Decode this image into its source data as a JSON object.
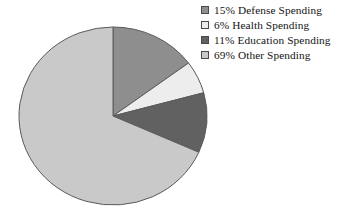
{
  "chart_data": {
    "type": "pie",
    "title": "",
    "subtitle": "",
    "xlabel": "",
    "ylabel": "",
    "grid": false,
    "legend_position": "top-right",
    "start_angle_oclock": 12,
    "direction": "clockwise",
    "categories": [
      "Defense Spending",
      "Health Spending",
      "Education Spending",
      "Other Spending"
    ],
    "values": [
      15,
      6,
      11,
      69
    ],
    "value_unit": "%",
    "colors": [
      "#8e8e8e",
      "#ededed",
      "#616161",
      "#c9c9c9"
    ],
    "slices": [
      {
        "label": "Defense Spending",
        "value": 15,
        "percent_text": "15%",
        "color": "#8e8e8e"
      },
      {
        "label": "Health Spending",
        "value": 6,
        "percent_text": "6%",
        "color": "#ededed"
      },
      {
        "label": "Education Spending",
        "value": 11,
        "percent_text": "11%",
        "color": "#616161"
      },
      {
        "label": "Other Spending",
        "value": 69,
        "percent_text": "69%",
        "color": "#c9c9c9"
      }
    ]
  },
  "legend": {
    "entries": [
      {
        "text": "15% Defense Spending",
        "color": "#8e8e8e"
      },
      {
        "text": "6% Health Spending",
        "color": "#ededed"
      },
      {
        "text": "11% Education Spending",
        "color": "#616161"
      },
      {
        "text": "69% Other Spending",
        "color": "#c9c9c9"
      }
    ]
  },
  "style": {
    "background": "#ffffff",
    "slice_outline": "#5a5a5a",
    "swatch_outline": "#4a4a4a",
    "text_color": "#141414"
  },
  "geometry": {
    "cx": 113,
    "cy": 116,
    "rx": 94,
    "ry": 89
  }
}
